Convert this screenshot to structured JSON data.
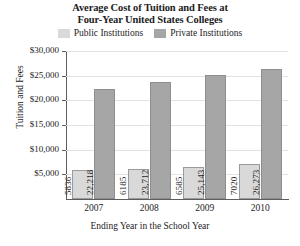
{
  "chart_data": {
    "type": "bar",
    "title": "Average Cost of Tuition and Fees at Four-Year United States Colleges",
    "title_lines": [
      "Average Cost of Tuition and Fees at",
      "Four-Year United States Colleges"
    ],
    "xlabel": "Ending Year in the School Year",
    "ylabel": "Tuition and Fees",
    "categories": [
      "2007",
      "2008",
      "2009",
      "2010"
    ],
    "series": [
      {
        "name": "Public Institutions",
        "color": "#d9d9d9",
        "values": [
          5836,
          6185,
          6585,
          7020
        ],
        "value_labels": [
          "5836",
          "6185",
          "6585",
          "7020"
        ]
      },
      {
        "name": "Private Institutions",
        "color": "#a6a6a6",
        "values": [
          22218,
          23712,
          25143,
          26273
        ],
        "value_labels": [
          "22,218",
          "23,712",
          "25,143",
          "26,273"
        ]
      }
    ],
    "ylim": [
      0,
      30000
    ],
    "ytick_values": [
      30000,
      25000,
      20000,
      15000,
      10000,
      5000
    ],
    "ytick_labels": [
      "$30,000",
      "$25,000",
      "$20,000",
      "$15,000",
      "$10,000",
      "$5,000"
    ],
    "grid": true,
    "legend_position": "top-center"
  }
}
